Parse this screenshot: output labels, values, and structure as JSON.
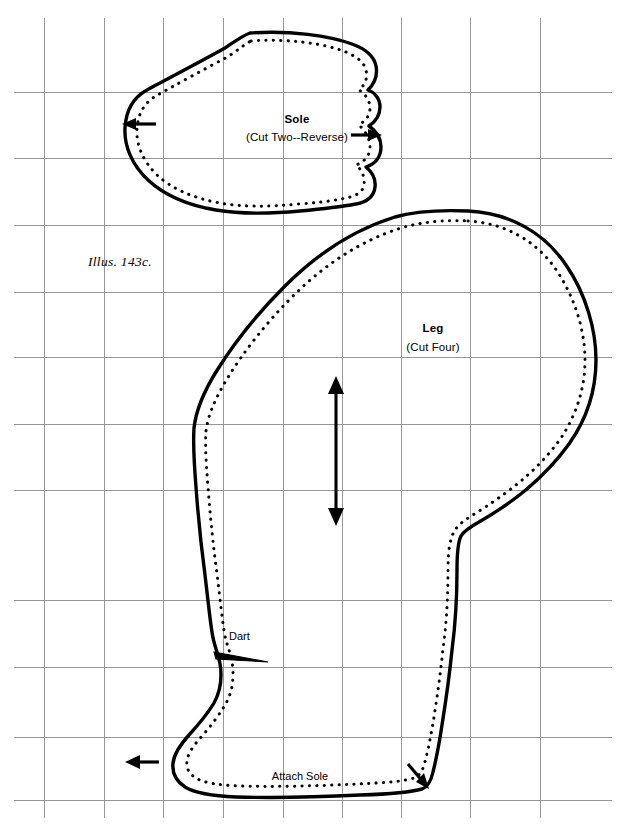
{
  "page": {
    "width": 617,
    "height": 826,
    "background_color": "#ffffff",
    "ink_color": "#000000",
    "grid_color": "#8c8c8c",
    "document_type": "sewing-pattern-sheet"
  },
  "figure": {
    "caption": "Illus. 143c.",
    "caption_x": 140,
    "caption_y": 255
  },
  "grid": {
    "visible": true,
    "vertical_x": [
      44,
      104,
      163,
      223,
      283,
      342,
      401,
      470,
      540
    ],
    "horizontal_y": [
      92,
      158,
      225,
      292,
      357,
      424,
      490,
      536,
      600,
      667,
      737,
      800
    ]
  },
  "pieces": [
    {
      "id": "sole",
      "name": "Sole",
      "title": "Sole",
      "subtitle": "(Cut Two--Reverse)",
      "title_x": 297,
      "title_y": 113,
      "subtitle_x": 297,
      "subtitle_y": 131,
      "notches": [
        {
          "id": "sole-notch-left",
          "x": 128,
          "y": 124,
          "direction": "right"
        },
        {
          "id": "sole-notch-right",
          "x": 372,
          "y": 135,
          "direction": "right"
        }
      ]
    },
    {
      "id": "leg",
      "name": "Leg",
      "title": "Leg",
      "subtitle": "(Cut Four)",
      "title_x": 433,
      "title_y": 322,
      "subtitle_x": 433,
      "subtitle_y": 341,
      "grainline": {
        "id": "leg-grainline",
        "x": 336,
        "y_top": 378,
        "y_bottom": 524,
        "double_headed": true
      },
      "markings": [
        {
          "id": "dart-label",
          "label": "Dart",
          "x": 229,
          "y": 637
        },
        {
          "id": "attach-sole-label",
          "label": "Attach Sole",
          "x": 300,
          "y": 777
        }
      ],
      "notches": [
        {
          "id": "toe-notch",
          "x": 130,
          "y": 762,
          "direction": "left"
        },
        {
          "id": "heel-notch",
          "x": 412,
          "y": 768,
          "direction": "down-left"
        }
      ]
    }
  ],
  "labels": {
    "sole_title": "Sole",
    "sole_subtitle": "(Cut Two--Reverse)",
    "leg_title": "Leg",
    "leg_subtitle": "(Cut Four)",
    "dart": "Dart",
    "attach_sole": "Attach Sole",
    "illustration": "Illus. 143c."
  }
}
